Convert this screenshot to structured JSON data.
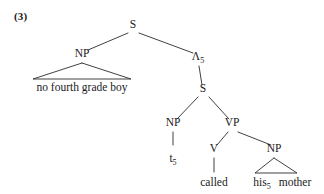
{
  "example": {
    "number": "(3)"
  },
  "tree": {
    "nodes": [
      {
        "id": "s-top",
        "label": "S",
        "sub": "",
        "x": 133,
        "y": 28
      },
      {
        "id": "np-subject",
        "label": "NP",
        "sub": "",
        "x": 82,
        "y": 57
      },
      {
        "id": "lambda",
        "label": "Λ",
        "sub": "5",
        "x": 198,
        "y": 60
      },
      {
        "id": "s-embedded",
        "label": "S",
        "sub": "",
        "x": 203,
        "y": 92
      },
      {
        "id": "np-trace",
        "label": "NP",
        "sub": "",
        "x": 173,
        "y": 126
      },
      {
        "id": "vp",
        "label": "VP",
        "sub": "",
        "x": 232,
        "y": 126
      },
      {
        "id": "v",
        "label": "V",
        "sub": "",
        "x": 214,
        "y": 152
      },
      {
        "id": "np-object",
        "label": "NP",
        "sub": "",
        "x": 274,
        "y": 152
      }
    ],
    "terminals": [
      {
        "id": "subject-phrase",
        "text": "no fourth grade boy",
        "sub": "",
        "x": 82,
        "y": 91
      },
      {
        "id": "trace",
        "text": "t",
        "sub": "5",
        "x": 173,
        "y": 162
      },
      {
        "id": "verb",
        "text": "called",
        "sub": "",
        "x": 214,
        "y": 186
      },
      {
        "id": "possessive",
        "text": "his",
        "sub": "5",
        "x": 262,
        "y": 186
      },
      {
        "id": "object-noun",
        "text": "mother",
        "sub": "",
        "x": 295,
        "y": 186
      }
    ],
    "branches": [
      {
        "id": "s-top-to-np",
        "x1": 128,
        "y1": 33,
        "x2": 88,
        "y2": 50
      },
      {
        "id": "s-top-to-lambda",
        "x1": 139,
        "y1": 33,
        "x2": 193,
        "y2": 53
      },
      {
        "id": "lambda-to-s",
        "x1": 199,
        "y1": 66,
        "x2": 202,
        "y2": 85
      },
      {
        "id": "s-embedded-to-np",
        "x1": 198,
        "y1": 97,
        "x2": 177,
        "y2": 119
      },
      {
        "id": "s-embedded-to-vp",
        "x1": 209,
        "y1": 97,
        "x2": 229,
        "y2": 119
      },
      {
        "id": "np-trace-to-t",
        "x1": 173,
        "y1": 132,
        "x2": 173,
        "y2": 145
      },
      {
        "id": "vp-to-v",
        "x1": 228,
        "y1": 132,
        "x2": 217,
        "y2": 145
      },
      {
        "id": "vp-to-np",
        "x1": 238,
        "y1": 132,
        "x2": 271,
        "y2": 145
      },
      {
        "id": "v-to-called",
        "x1": 214,
        "y1": 158,
        "x2": 214,
        "y2": 172
      }
    ],
    "triangles": [
      {
        "id": "subject-triangle",
        "apex_x": 82,
        "apex_y": 63,
        "left_x": 33,
        "right_x": 131,
        "base_y": 79
      },
      {
        "id": "object-triangle",
        "apex_x": 274,
        "apex_y": 158,
        "left_x": 255,
        "right_x": 297,
        "base_y": 173
      }
    ]
  }
}
